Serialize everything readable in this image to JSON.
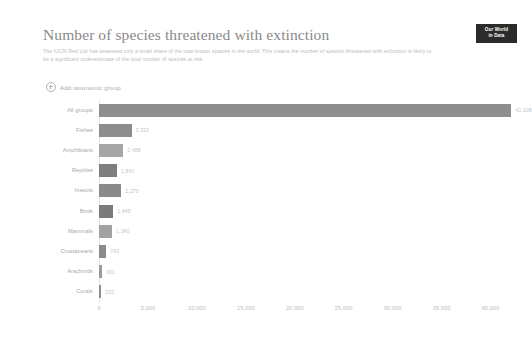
{
  "header": {
    "title": "Number of species threatened with extinction",
    "subtitle": "The IUCN Red List has assessed only a small share of the total known species in the world. This means the number of species threatened with extinction is likely to be a significant underestimate of the total number of species at risk.",
    "logo_line1": "Our World",
    "logo_line2": "in Data"
  },
  "controls": {
    "add_group_label": "Add taxonomic group",
    "add_group_icon": "plus-circle-icon"
  },
  "chart_data": {
    "type": "bar",
    "orientation": "horizontal",
    "title": "Number of species threatened with extinction",
    "xlabel": "",
    "ylabel": "",
    "xlim": [
      0,
      42500
    ],
    "grid": false,
    "legend": "none",
    "xticks": [
      "0",
      "5,000",
      "10,000",
      "15,000",
      "20,000",
      "25,000",
      "30,000",
      "35,000",
      "40,000"
    ],
    "xtick_values": [
      0,
      5000,
      10000,
      15000,
      20000,
      25000,
      30000,
      35000,
      40000
    ],
    "categories": [
      "All groups",
      "Fishes",
      "Amphibians",
      "Reptiles",
      "Insects",
      "Birds",
      "Mammals",
      "Crustaceans",
      "Arachnids",
      "Corals"
    ],
    "values": [
      42108,
      3332,
      2488,
      1841,
      2270,
      1445,
      1340,
      743,
      301,
      232
    ],
    "value_labels": [
      "42,108",
      "3,332",
      "2,488",
      "1,841",
      "2,270",
      "1,445",
      "1,340",
      "743",
      "301",
      "232"
    ],
    "colors": [
      "#8e8e8e",
      "#8d8d8d",
      "#a6a6a6",
      "#7e7e7e",
      "#8a8a8a",
      "#7b7b7b",
      "#a2a2a2",
      "#8b8b8b",
      "#9a9a9a",
      "#8f8f8f"
    ]
  }
}
